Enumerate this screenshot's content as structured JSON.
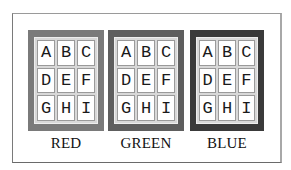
{
  "panels": [
    {
      "label": "RED",
      "color": "#7a7a7a",
      "cells": [
        "A",
        "B",
        "C",
        "D",
        "E",
        "F",
        "G",
        "H",
        "I"
      ]
    },
    {
      "label": "GREEN",
      "color": "#5e5e5e",
      "cells": [
        "A",
        "B",
        "C",
        "D",
        "E",
        "F",
        "G",
        "H",
        "I"
      ]
    },
    {
      "label": "BLUE",
      "color": "#3a3a3a",
      "cells": [
        "A",
        "B",
        "C",
        "D",
        "E",
        "F",
        "G",
        "H",
        "I"
      ]
    }
  ]
}
